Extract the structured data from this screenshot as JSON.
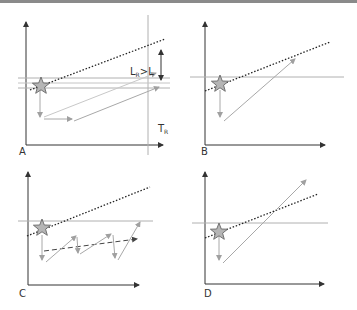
{
  "figure": {
    "panels": [
      {
        "id": "A",
        "label": "A",
        "annotation_lr": "L",
        "annotation_lr_sub": "R",
        "annotation_gt": ">L",
        "annotation_tr": "T",
        "annotation_tr_sub": "R"
      },
      {
        "id": "B",
        "label": "B"
      },
      {
        "id": "C",
        "label": "C"
      },
      {
        "id": "D",
        "label": "D"
      }
    ]
  },
  "colors": {
    "axis": "#333333",
    "threshold_line": "#b0b0b0",
    "trajectory": "#a8a8a8",
    "dotted_trend": "#222222",
    "star_fill": "#b5b5b5",
    "star_stroke": "#666666",
    "dashed_mean": "#444444"
  }
}
